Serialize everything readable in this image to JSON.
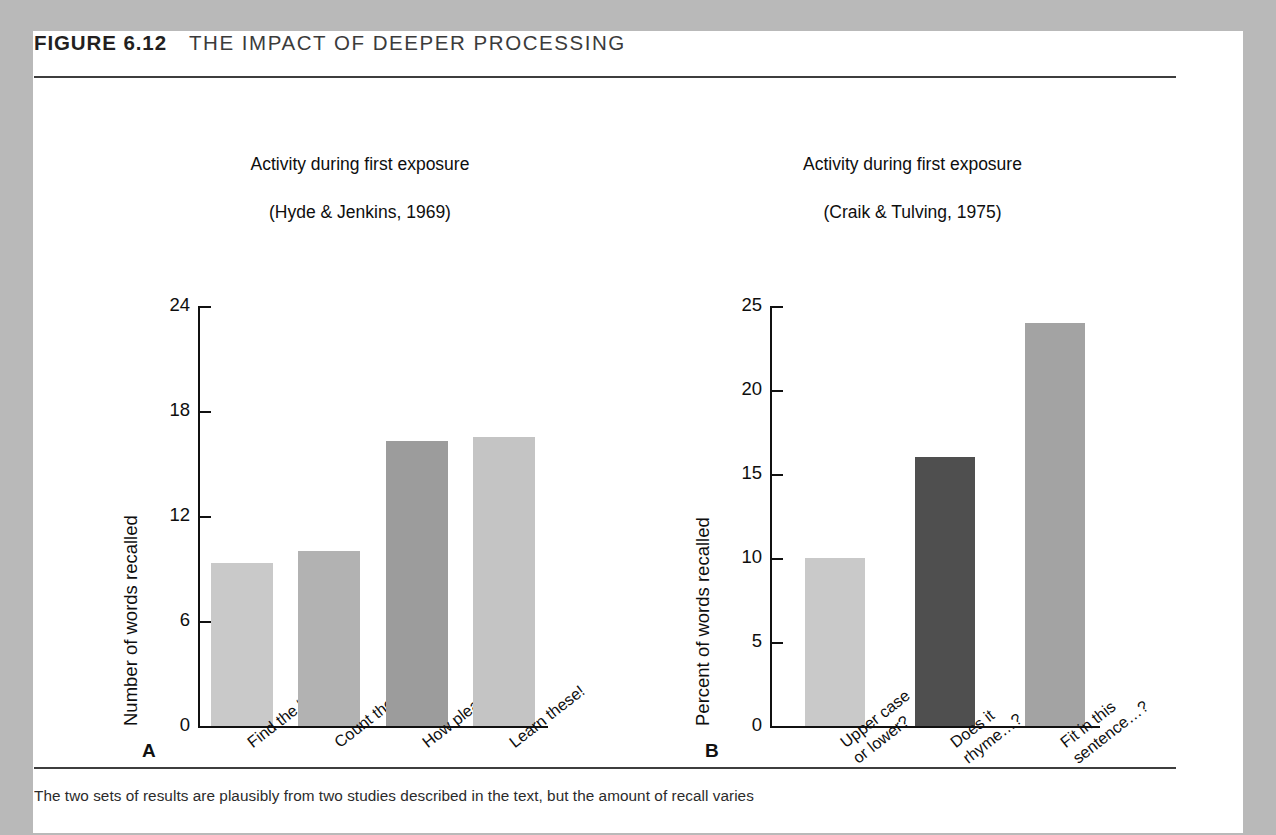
{
  "figure": {
    "number": "FIGURE 6.12",
    "title": "THE IMPACT OF DEEPER PROCESSING",
    "caption": "The two sets of results are plausibly from two studies described in the text, but the amount of recall varies",
    "panel_a_letter": "A",
    "panel_b_letter": "B"
  },
  "colors": {
    "page_background": "#b9b9b9",
    "card_background": "#ffffff",
    "rule": "#3d3d3d",
    "axis": "#111111",
    "text": "#0e0e0e",
    "bar_light": "#c8c8c8",
    "bar_mid": "#b0b0b0",
    "bar_dark": "#9a9a9a",
    "bar_darkest": "#4f4f4f"
  },
  "chart_data": [
    {
      "type": "bar",
      "panel": "A",
      "title": "Activity during first exposure\n(Hyde & Jenkins, 1969)",
      "title_line1": "Activity during first exposure",
      "title_line2": "(Hyde & Jenkins, 1969)",
      "xlabel": "",
      "ylabel": "Number of words recalled",
      "ylim": [
        0,
        24
      ],
      "yticks": [
        0,
        6,
        12,
        18,
        24
      ],
      "ytick_labels": [
        "0",
        "6",
        "12",
        "18",
        "24"
      ],
      "grid": false,
      "legend": "none",
      "categories": [
        "Find the “e.”",
        "Count the letters.",
        "How pleasant?",
        "Learn these!"
      ],
      "values": [
        9.3,
        10.0,
        16.3,
        16.5
      ],
      "bar_colors": [
        "#c9c9c9",
        "#b2b2b2",
        "#9c9c9c",
        "#c4c4c4"
      ]
    },
    {
      "type": "bar",
      "panel": "B",
      "title": "Activity during first exposure\n(Craik & Tulving, 1975)",
      "title_line1": "Activity during first exposure",
      "title_line2": "(Craik & Tulving, 1975)",
      "xlabel": "",
      "ylabel": "Percent of words recalled",
      "ylim": [
        0,
        25
      ],
      "yticks": [
        0,
        5,
        10,
        15,
        20,
        25
      ],
      "ytick_labels": [
        "0",
        "5",
        "10",
        "15",
        "20",
        "25"
      ],
      "grid": false,
      "legend": "none",
      "categories": [
        "Upper case\nor lower?",
        "Does it\nrhyme…?",
        "Fit in this\nsentence…?"
      ],
      "values": [
        10,
        16,
        24
      ],
      "bar_colors": [
        "#c9c9c9",
        "#4f4f4f",
        "#a3a3a3"
      ]
    }
  ]
}
